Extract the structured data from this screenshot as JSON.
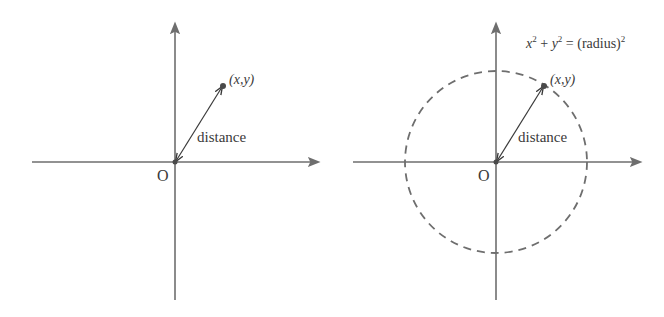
{
  "colors": {
    "axis": "#6e6e6e",
    "vector": "#3a3a3a",
    "point": "#4a4a4a",
    "circle": "#6e6e6e",
    "text": "#3a3a3a"
  },
  "left_diagram": {
    "origin_label": "O",
    "point_label": "(x,y)",
    "vector_label": "distance"
  },
  "right_diagram": {
    "origin_label": "O",
    "point_label": "(x,y)",
    "vector_label": "distance",
    "equation": {
      "x": "x",
      "x_exp": "2",
      "plus": " + ",
      "y": "y",
      "y_exp": "2",
      "equals": " = (radius)",
      "r_exp": "2"
    },
    "circle_style": "dashed"
  }
}
